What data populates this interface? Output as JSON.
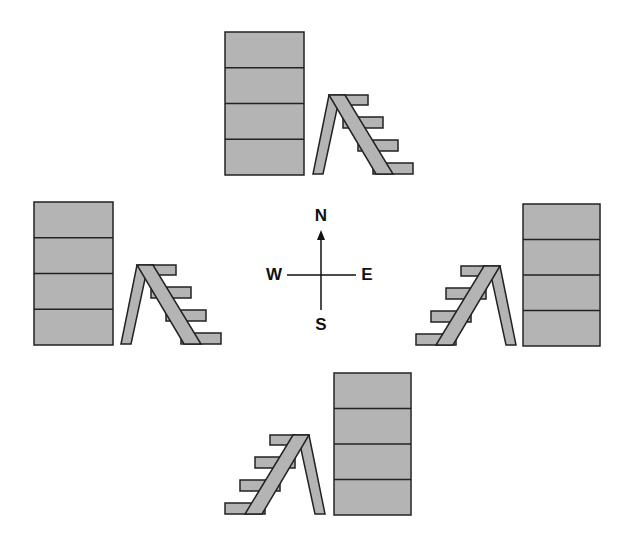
{
  "diagram": {
    "type": "compass-layout",
    "colors": {
      "fill": "#b4b4b4",
      "stroke": "#222222",
      "background": "#ffffff"
    },
    "compass": {
      "center": [
        321,
        275
      ],
      "labels": {
        "north": "N",
        "south": "S",
        "east": "E",
        "west": "W"
      }
    },
    "groups": [
      {
        "id": "north",
        "box": {
          "x": 225,
          "y": 32,
          "w": 79,
          "h": 143,
          "sections": 4
        },
        "stair": {
          "x": 313,
          "y": 95,
          "mirror": false
        }
      },
      {
        "id": "west",
        "box": {
          "x": 34,
          "y": 202,
          "w": 79,
          "h": 142,
          "sections": 4
        },
        "stair": {
          "x": 121,
          "y": 265,
          "mirror": false
        }
      },
      {
        "id": "east",
        "box": {
          "x": 524,
          "y": 204,
          "w": 77,
          "h": 142,
          "sections": 4
        },
        "stair": {
          "x": 416,
          "y": 266,
          "mirror": true
        }
      },
      {
        "id": "south",
        "box": {
          "x": 334,
          "y": 373,
          "w": 77,
          "h": 142,
          "sections": 4
        },
        "stair": {
          "x": 225,
          "y": 435,
          "mirror": true
        }
      }
    ]
  }
}
